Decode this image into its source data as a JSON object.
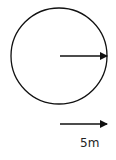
{
  "diagram": {
    "shape": "circle",
    "radius_arrow": "arrow-right",
    "scale_arrow": "arrow-right",
    "scale_label": "5m",
    "stroke_color": "#111111",
    "background": "#ffffff"
  }
}
